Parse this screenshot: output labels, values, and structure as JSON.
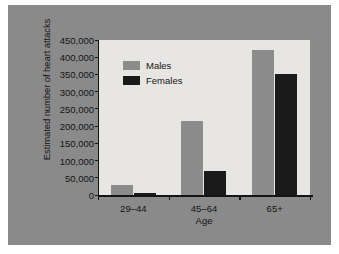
{
  "chart_data": {
    "type": "bar",
    "title": "",
    "xlabel": "Age",
    "ylabel": "Estimated number of heart attacks",
    "categories": [
      "29–44",
      "45–64",
      "65+"
    ],
    "series": [
      {
        "name": "Males",
        "color": "#8c8c8c",
        "values": [
          28000,
          215000,
          420000
        ]
      },
      {
        "name": "Females",
        "color": "#1a1a1a",
        "values": [
          5000,
          70000,
          350000
        ]
      }
    ],
    "ylim": [
      0,
      450000
    ],
    "ytick_step": 50000,
    "ytick_labels": [
      "0",
      "50,000",
      "100,000",
      "150,000",
      "200,000",
      "250,000",
      "300,000",
      "350,000",
      "400,000",
      "450,000"
    ],
    "grid": false,
    "legend_position": "top-left-inside"
  },
  "legend": {
    "entries": [
      {
        "label": "Males"
      },
      {
        "label": "Females"
      }
    ]
  },
  "colors": {
    "frame": "#8a8a8a",
    "plot_background": "#e8e6e2",
    "axis": "#141414",
    "males": "#8c8c8c",
    "females": "#1a1a1a"
  }
}
